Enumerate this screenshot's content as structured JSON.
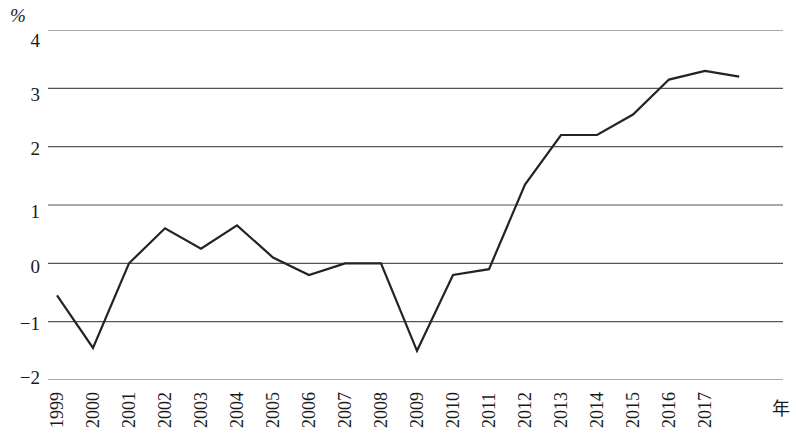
{
  "chart_data": {
    "type": "line",
    "title": "",
    "subtitle": "",
    "xlabel": "年",
    "ylabel": "%",
    "x": [
      1999,
      2000,
      2001,
      2002,
      2003,
      2004,
      2005,
      2006,
      2007,
      2008,
      2009,
      2010,
      2011,
      2012,
      2013,
      2014,
      2015,
      2016,
      2017
    ],
    "categories": [
      "1999",
      "2000",
      "2001",
      "2002",
      "2003",
      "2004",
      "2005",
      "2006",
      "2007",
      "2008",
      "2009",
      "2010",
      "2011",
      "2012",
      "2013",
      "2014",
      "2015",
      "2016",
      "2017"
    ],
    "values": [
      -0.55,
      -1.45,
      0.0,
      0.6,
      0.25,
      0.65,
      0.1,
      -0.2,
      0.0,
      0.0,
      -1.5,
      -0.2,
      -0.1,
      1.35,
      2.2,
      2.2,
      2.55,
      3.15,
      3.3
    ],
    "series": [
      {
        "name": "",
        "values": [
          -0.55,
          -1.45,
          0.0,
          0.6,
          0.25,
          0.65,
          0.1,
          -0.2,
          0.0,
          0.0,
          -1.5,
          -0.2,
          -0.1,
          1.35,
          2.2,
          2.2,
          2.55,
          3.15,
          3.3
        ]
      }
    ],
    "tail_value": 3.2,
    "ylim": [
      -2,
      4
    ],
    "xlim": [
      1999,
      2017
    ],
    "y_ticks": [
      4,
      3,
      2,
      1,
      0,
      -1,
      -2
    ],
    "y_tick_labels": [
      "4",
      "3",
      "2",
      "1",
      "0",
      "−1",
      "−2"
    ],
    "grid": true,
    "grid_axis": "y",
    "legend": "none",
    "line_color": "#232323",
    "grid_color": "#555555"
  }
}
